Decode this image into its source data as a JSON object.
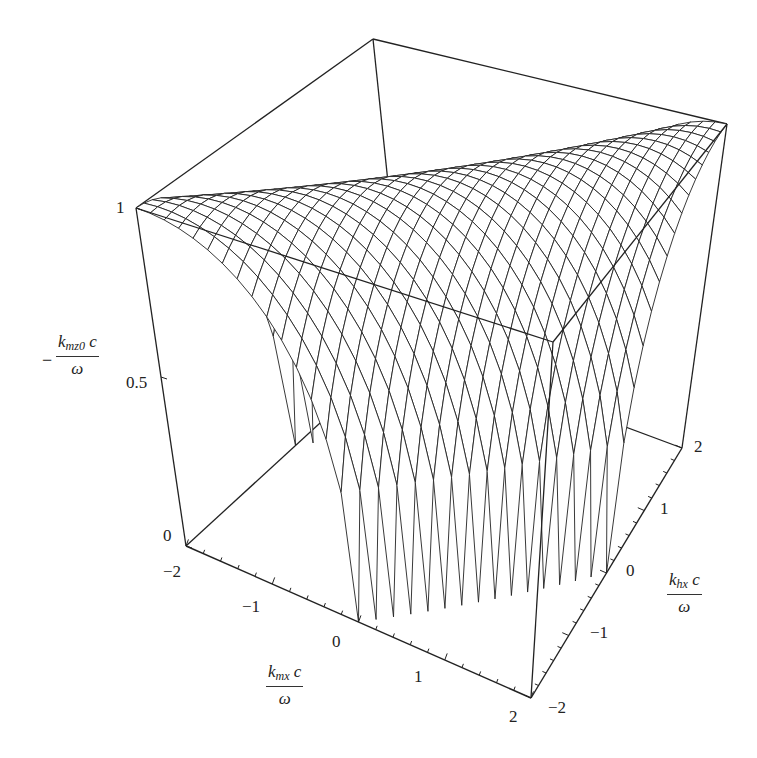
{
  "chart_data": {
    "type": "surface3d",
    "title": "",
    "function": "z = sqrt(1 - ((x - y)/2)^2) for |x - y| <= 2",
    "x": {
      "label_num": "k",
      "label_sub": "mx",
      "label_rest": " c",
      "label_den": "ω",
      "label_text": "k_mx c / ω",
      "range": [
        -2,
        2
      ],
      "ticks": [
        "−2",
        "−1",
        "0",
        "1",
        "2"
      ]
    },
    "y": {
      "label_num": "k",
      "label_sub": "hx",
      "label_rest": " c",
      "label_den": "ω",
      "label_text": "k_hx c / ω",
      "range": [
        -2,
        2
      ],
      "ticks": [
        "−2",
        "−1",
        "0",
        "1",
        "2"
      ]
    },
    "z": {
      "label_prefix": "−",
      "label_num": "k",
      "label_sub": "mz0",
      "label_rest": " c",
      "label_den": "ω",
      "label_text": "− k_mz0 c / ω",
      "range": [
        0,
        1
      ],
      "ticks": [
        "0",
        "0.5",
        "1"
      ]
    },
    "grid_lines": 30,
    "peak_value": 1,
    "box": true,
    "line_color": "#222222",
    "background": "#ffffff"
  }
}
